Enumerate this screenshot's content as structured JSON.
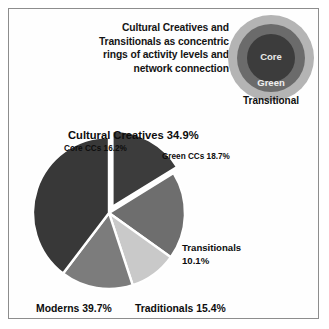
{
  "figure": {
    "title_lines": [
      "Cultural Creatives and",
      "Transitionals as concentric",
      "rings of activity levels and",
      "network connection"
    ]
  },
  "rings": {
    "core_label": "Core",
    "green_label": "Green",
    "transitional_label": "Transitional",
    "colors": {
      "outer": "#b4b4b4",
      "middle": "#6b6b6b",
      "core": "#3c3c3c"
    }
  },
  "labels": {
    "cultural_creatives": "Cultural Creatives 34.9%",
    "core_ccs": "Core CCs 16.2%",
    "green_ccs": "Green CCs  18.7%",
    "transitionals_name": "Transitionals",
    "transitionals_value": "10.1%",
    "moderns": "Moderns 39.7%",
    "traditionals": "Traditionals 15.4%"
  },
  "chart_data": {
    "type": "pie",
    "title": "Cultural Creatives and Transitionals as concentric rings of activity levels and network connection",
    "categories": [
      "Core CCs",
      "Green CCs",
      "Transitionals",
      "Traditionals",
      "Moderns"
    ],
    "values": [
      16.2,
      18.7,
      10.1,
      15.4,
      39.7
    ],
    "unit": "%",
    "start_angle_deg": 0,
    "direction": "clockwise",
    "exploded_slices": [
      "Core CCs"
    ],
    "group_totals": [
      {
        "name": "Cultural Creatives",
        "value": 34.9,
        "members": [
          "Core CCs",
          "Green CCs"
        ]
      }
    ],
    "colors": [
      "#3c3c3c",
      "#6e6e6e",
      "#c9c9c9",
      "#7c7c7c",
      "#383838"
    ],
    "slice_separator_color": "#ffffff",
    "legend": "labels-on-chart",
    "grid": false
  }
}
